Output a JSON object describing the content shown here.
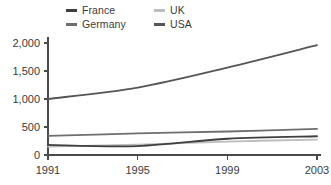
{
  "chart_data": {
    "type": "line",
    "title": "",
    "subtitle": "",
    "xlabel": "",
    "ylabel": "",
    "x": [
      1991,
      1995,
      1999,
      2003
    ],
    "xlim": [
      1991,
      2003
    ],
    "ylim": [
      0,
      2000
    ],
    "x_tick_labels": [
      "1991",
      "1995",
      "1999",
      "2003"
    ],
    "y_tick_labels": [
      "0",
      "500",
      "1,000",
      "1,500",
      "2,000"
    ],
    "y_ticks": [
      0,
      500,
      1000,
      1500,
      2000
    ],
    "grid": false,
    "legend_position": "top-center",
    "series": [
      {
        "name": "France",
        "color": "#3f3f3f",
        "values": [
          180,
          160,
          290,
          335
        ]
      },
      {
        "name": "Germany",
        "color": "#6e6e6e",
        "values": [
          340,
          385,
          420,
          465
        ]
      },
      {
        "name": "UK",
        "color": "#bdbdbd",
        "values": [
          150,
          185,
          240,
          275
        ]
      },
      {
        "name": "USA",
        "color": "#555555",
        "values": [
          1000,
          1205,
          1560,
          1960
        ]
      }
    ],
    "legend_order": [
      "France",
      "UK",
      "Germany",
      "USA"
    ]
  },
  "legend": {
    "entries": [
      {
        "label": "France",
        "swatch_color": "#3f3f3f"
      },
      {
        "label": "UK",
        "swatch_color": "#bdbdbd"
      },
      {
        "label": "Germany",
        "swatch_color": "#6e6e6e"
      },
      {
        "label": "USA",
        "swatch_color": "#555555"
      }
    ]
  },
  "axes": {
    "y_labels": [
      "2,000",
      "1,500",
      "1,000",
      "500",
      "0"
    ],
    "x_labels": [
      "1991",
      "1995",
      "1999",
      "2003"
    ],
    "axis_color": "#4a4a4a"
  }
}
